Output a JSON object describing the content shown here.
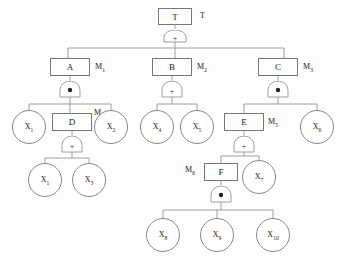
{
  "diagram": {
    "type": "fault-tree",
    "title": "T",
    "top_label": "T",
    "gate_symbols": {
      "and": "•",
      "or": "+"
    },
    "nodes": [
      {
        "id": "T",
        "label": "T",
        "shape": "box",
        "side_label": "T",
        "gate": "or",
        "x": 158,
        "y": 8,
        "w": 34,
        "h": 17
      },
      {
        "id": "A",
        "label": "A",
        "shape": "box",
        "side_label": "M1",
        "gate": "and",
        "x": 50,
        "y": 58,
        "w": 40,
        "h": 18
      },
      {
        "id": "B",
        "label": "B",
        "shape": "box",
        "side_label": "M2",
        "gate": "or",
        "x": 152,
        "y": 58,
        "w": 40,
        "h": 18
      },
      {
        "id": "C",
        "label": "C",
        "shape": "box",
        "side_label": "M3",
        "gate": "and",
        "x": 258,
        "y": 58,
        "w": 40,
        "h": 18
      },
      {
        "id": "X1",
        "label": "X1",
        "shape": "circle",
        "side_label": "",
        "gate": "",
        "x": 12,
        "y": 110,
        "w": 34,
        "h": 34
      },
      {
        "id": "D",
        "label": "D",
        "shape": "box",
        "side_label": "M4",
        "gate": "or",
        "x": 52,
        "y": 113,
        "w": 40,
        "h": 18
      },
      {
        "id": "X2",
        "label": "X2",
        "shape": "circle",
        "side_label": "",
        "gate": "",
        "x": 94,
        "y": 110,
        "w": 34,
        "h": 34
      },
      {
        "id": "X4",
        "label": "X4",
        "shape": "circle",
        "side_label": "",
        "gate": "",
        "x": 140,
        "y": 110,
        "w": 34,
        "h": 34
      },
      {
        "id": "X5",
        "label": "X5",
        "shape": "circle",
        "side_label": "",
        "gate": "",
        "x": 180,
        "y": 110,
        "w": 34,
        "h": 34
      },
      {
        "id": "E",
        "label": "E",
        "shape": "box",
        "side_label": "M5",
        "gate": "or",
        "x": 224,
        "y": 113,
        "w": 40,
        "h": 18
      },
      {
        "id": "X6",
        "label": "X6",
        "shape": "circle",
        "side_label": "",
        "gate": "",
        "x": 300,
        "y": 110,
        "w": 34,
        "h": 34
      },
      {
        "id": "X1b",
        "label": "X1",
        "shape": "circle",
        "side_label": "",
        "gate": "",
        "x": 28,
        "y": 163,
        "w": 34,
        "h": 34
      },
      {
        "id": "X3",
        "label": "X3",
        "shape": "circle",
        "side_label": "",
        "gate": "",
        "x": 72,
        "y": 163,
        "w": 34,
        "h": 34
      },
      {
        "id": "F",
        "label": "F",
        "shape": "box",
        "side_label": "M6",
        "gate": "and",
        "x": 204,
        "y": 163,
        "w": 34,
        "h": 18
      },
      {
        "id": "X7",
        "label": "X7",
        "shape": "circle",
        "side_label": "",
        "gate": "",
        "x": 242,
        "y": 160,
        "w": 34,
        "h": 34
      },
      {
        "id": "X8",
        "label": "X8",
        "shape": "circle",
        "side_label": "",
        "gate": "",
        "x": 146,
        "y": 218,
        "w": 34,
        "h": 34
      },
      {
        "id": "X9",
        "label": "X9",
        "shape": "circle",
        "side_label": "",
        "gate": "",
        "x": 200,
        "y": 218,
        "w": 34,
        "h": 34
      },
      {
        "id": "X10",
        "label": "X10",
        "shape": "circle",
        "side_label": "",
        "gate": "",
        "x": 256,
        "y": 218,
        "w": 34,
        "h": 34
      }
    ],
    "edges": [
      {
        "from": "T",
        "to": [
          "A",
          "B",
          "C"
        ]
      },
      {
        "from": "A",
        "to": [
          "X1",
          "D",
          "X2"
        ]
      },
      {
        "from": "B",
        "to": [
          "X4",
          "X5"
        ]
      },
      {
        "from": "C",
        "to": [
          "E",
          "X6"
        ]
      },
      {
        "from": "D",
        "to": [
          "X1b",
          "X3"
        ]
      },
      {
        "from": "E",
        "to": [
          "F",
          "X7"
        ]
      },
      {
        "from": "F",
        "to": [
          "X8",
          "X9",
          "X10"
        ]
      }
    ],
    "colors": {
      "stroke": "#777777",
      "text": "#222222",
      "background": "#ffffff"
    }
  }
}
